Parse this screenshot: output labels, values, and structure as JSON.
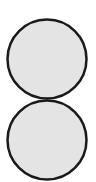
{
  "diagram": {
    "shapes": [
      {
        "type": "circle",
        "label": "top-circle"
      },
      {
        "type": "circle",
        "label": "bottom-circle"
      }
    ],
    "colors": {
      "fill": "#e4e4e4",
      "stroke": "#1a1a1a",
      "background": "#ffffff"
    }
  }
}
